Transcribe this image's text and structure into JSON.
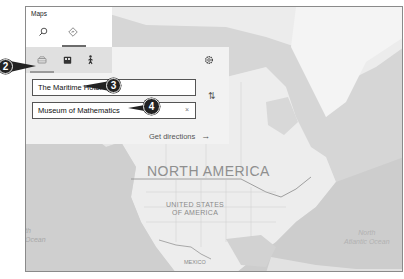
{
  "app": {
    "title": "Maps"
  },
  "top_tabs": [
    {
      "name": "search",
      "icon": "search-icon",
      "selected": false
    },
    {
      "name": "directions",
      "icon": "directions-icon",
      "selected": true
    }
  ],
  "directions_panel": {
    "modes": [
      {
        "name": "drive",
        "icon": "car-icon",
        "selected": true
      },
      {
        "name": "transit",
        "icon": "bus-icon",
        "selected": false
      },
      {
        "name": "walk",
        "icon": "walk-icon",
        "selected": false
      }
    ],
    "settings_icon": "gear-icon",
    "from_value": "The Maritime Hotel",
    "to_value": "Museum of Mathematics",
    "clear_glyph": "×",
    "swap_glyph": "⇅",
    "get_directions_label": "Get directions",
    "get_directions_arrow": "→"
  },
  "map": {
    "labels": {
      "continent": "NORTH AMERICA",
      "country_line1": "UNITED STATES",
      "country_line2": "OF AMERICA",
      "mexico": "MEXICO",
      "pacific_line1": "th",
      "pacific_line2": "Ocean",
      "atlantic_line1": "North",
      "atlantic_line2": "Atlantic Ocean"
    }
  },
  "callouts": [
    {
      "number": "2"
    },
    {
      "number": "3"
    },
    {
      "number": "4"
    }
  ],
  "colors": {
    "callout_bg": "#222222",
    "panel_bg": "#f2f2f2",
    "map_land": "#ececec",
    "map_water": "#d4d4d4"
  }
}
